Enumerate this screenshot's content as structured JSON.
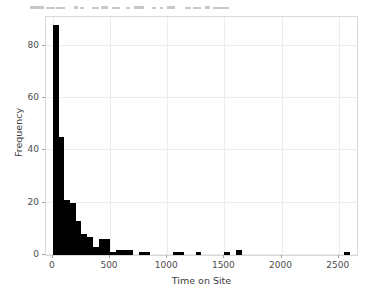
{
  "toolbar": {
    "description": "partially cropped application toolbar row at top of screenshot",
    "visible_glyphs": "—▬▬ ↑↑ ┌┐ □ ☰ │─ ↕ ‖‖ ▤▥ ∕ ▬▬▬ □"
  },
  "chart_data": {
    "type": "bar",
    "title": "",
    "subtitle": "",
    "xlabel": "Time on Site",
    "ylabel": "Frequency",
    "xlim": [
      -60,
      2660
    ],
    "ylim": [
      0,
      91
    ],
    "xticks": [
      0,
      500,
      1000,
      1500,
      2000,
      2500
    ],
    "xticklabels": [
      "0",
      "500",
      "1000",
      "1500",
      "2000",
      "2500"
    ],
    "yticks": [
      0,
      20,
      40,
      60,
      80
    ],
    "yticklabels": [
      "0",
      "20",
      "40",
      "60",
      "80"
    ],
    "grid": true,
    "legend": null,
    "bar_color": "#000000",
    "grid_color": "#ececec",
    "panel_border_color": "#d9d9d9",
    "background_color": "#ffffff",
    "bin_width": 50,
    "bin_starts": [
      0,
      50,
      100,
      150,
      200,
      250,
      300,
      350,
      400,
      450,
      500,
      550,
      600,
      650,
      700,
      750,
      800,
      850,
      900,
      950,
      1000,
      1050,
      1100,
      1150,
      1200,
      1250,
      1300,
      1350,
      1400,
      1450,
      1500,
      1550,
      1600,
      1650,
      1700,
      1750,
      1800,
      1850,
      1900,
      1950,
      2000,
      2050,
      2100,
      2150,
      2200,
      2250,
      2300,
      2350,
      2400,
      2450,
      2500,
      2550,
      2600
    ],
    "values": [
      88,
      45,
      21,
      20,
      13,
      8,
      7,
      3,
      6,
      6,
      1,
      2,
      2,
      2,
      0,
      1,
      1,
      0,
      0,
      0,
      0,
      1,
      1,
      0,
      0,
      1,
      0,
      0,
      0,
      0,
      1,
      0,
      2,
      0,
      0,
      0,
      0,
      0,
      0,
      0,
      0,
      0,
      0,
      0,
      0,
      0,
      0,
      0,
      0,
      0,
      0,
      1,
      0
    ]
  }
}
